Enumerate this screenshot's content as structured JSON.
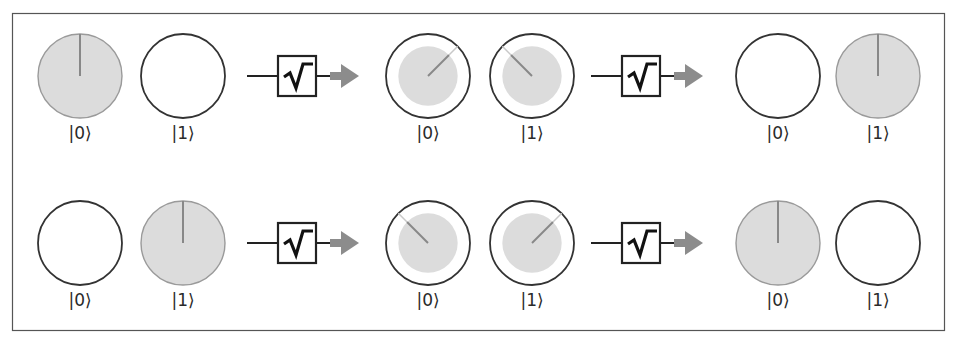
{
  "diagram": {
    "type": "quantum-sqrt-not-gate-sequence",
    "colors": {
      "frame": "#555555",
      "circle_outline": "#333333",
      "fill": "#dcdcdc",
      "fill_outline": "#9a9a9a",
      "phase_line": "#888888",
      "phase_line_light": "#c8c8c8",
      "gate_box": "#222222",
      "arrow": "#8c8c8c"
    },
    "gate_symbol": "√",
    "gate_name": "sqrt-not-gate",
    "rows": [
      {
        "name": "row-input-0",
        "stages": [
          {
            "name": "input",
            "qubits": [
              {
                "label": "|0⟩",
                "magnitude": 1.0,
                "phase_deg": 0
              },
              {
                "label": "|1⟩",
                "magnitude": 0.0,
                "phase_deg": null
              }
            ]
          },
          {
            "name": "after-first-sqrt-not",
            "qubits": [
              {
                "label": "|0⟩",
                "magnitude": 0.707,
                "phase_deg": 45
              },
              {
                "label": "|1⟩",
                "magnitude": 0.707,
                "phase_deg": -45
              }
            ]
          },
          {
            "name": "after-second-sqrt-not",
            "qubits": [
              {
                "label": "|0⟩",
                "magnitude": 0.0,
                "phase_deg": null
              },
              {
                "label": "|1⟩",
                "magnitude": 1.0,
                "phase_deg": 0
              }
            ]
          }
        ]
      },
      {
        "name": "row-input-1",
        "stages": [
          {
            "name": "input",
            "qubits": [
              {
                "label": "|0⟩",
                "magnitude": 0.0,
                "phase_deg": null
              },
              {
                "label": "|1⟩",
                "magnitude": 1.0,
                "phase_deg": 0
              }
            ]
          },
          {
            "name": "after-first-sqrt-not",
            "qubits": [
              {
                "label": "|0⟩",
                "magnitude": 0.707,
                "phase_deg": -45
              },
              {
                "label": "|1⟩",
                "magnitude": 0.707,
                "phase_deg": 45
              }
            ]
          },
          {
            "name": "after-second-sqrt-not",
            "qubits": [
              {
                "label": "|0⟩",
                "magnitude": 1.0,
                "phase_deg": 0
              },
              {
                "label": "|1⟩",
                "magnitude": 0.0,
                "phase_deg": null
              }
            ]
          }
        ]
      }
    ]
  }
}
